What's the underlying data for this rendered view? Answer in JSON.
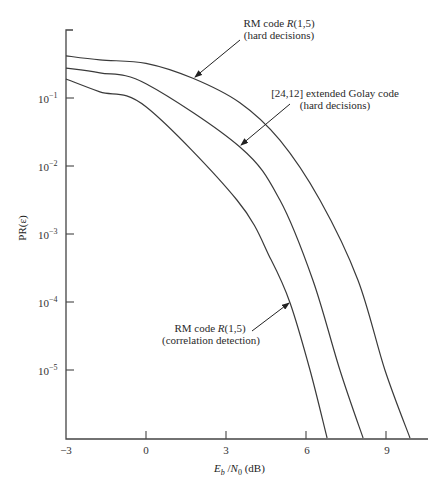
{
  "chart_data": {
    "type": "line",
    "title": "",
    "xlabel": "E_b / N_0 (dB)",
    "ylabel": "PR(ε)",
    "xlim": [
      -3,
      10.5
    ],
    "ylim": [
      1e-06,
      1
    ],
    "yscale": "log",
    "grid": false,
    "legend": "inline annotations with arrows",
    "x_ticks": [
      "-3",
      "0",
      "3",
      "6",
      "9"
    ],
    "x_tick_values": [
      -3,
      0,
      3,
      6,
      9
    ],
    "y_ticks": [
      "10^-1",
      "10^-2",
      "10^-3",
      "10^-4",
      "10^-5"
    ],
    "y_tick_values": [
      0.1,
      0.01,
      0.001,
      0.0001,
      1e-05
    ],
    "series": [
      {
        "name": "RM code R(1,5) (hard decisions)",
        "x": [
          -3,
          -1.73,
          0,
          1.76,
          3.52,
          5.02,
          6.52,
          7.95,
          8.96,
          9.9
        ],
        "log10_y": [
          -0.38,
          -0.44,
          -0.49,
          -0.71,
          -1.07,
          -1.62,
          -2.5,
          -3.68,
          -5.0,
          -6.0
        ]
      },
      {
        "name": "[24,12] extended Golay code (hard decisions)",
        "x": [
          -3,
          -1.73,
          0,
          3.52,
          5.02,
          6.26,
          7.27,
          8.14
        ],
        "log10_y": [
          -0.56,
          -0.63,
          -0.79,
          -1.72,
          -2.5,
          -3.68,
          -5.0,
          -6.0
        ]
      },
      {
        "name": "RM code R(1,5) (correlation detection)",
        "x": [
          -3,
          -1.73,
          0,
          3.41,
          4.69,
          5.4,
          6.15,
          6.79
        ],
        "log10_y": [
          -0.72,
          -0.91,
          -1.13,
          -2.5,
          -3.38,
          -4.01,
          -5.0,
          -6.0
        ]
      }
    ],
    "annotations": [
      {
        "line1_pre": "RM code ",
        "line1_it": "R",
        "line1_post": "(1,5)",
        "line2": "(hard decisions)"
      },
      {
        "line1_pre": "[24,12] extended Golay code",
        "line1_it": "",
        "line1_post": "",
        "line2": "(hard decisions)"
      },
      {
        "line1_pre": "RM code ",
        "line1_it": "R",
        "line1_post": "(1,5)",
        "line2": "(correlation detection)"
      }
    ]
  },
  "axis": {
    "ylabel": "PR(ε)",
    "xlabel_E": "E",
    "xlabel_b": "b",
    "xlabel_slash": " /",
    "xlabel_N": "N",
    "xlabel_0": "0",
    "xlabel_unit": " (dB)",
    "ytick_base": "10",
    "ytick_exps": [
      "−1",
      "−2",
      "−3",
      "−4",
      "−5"
    ],
    "xticks": [
      "−3",
      "0",
      "3",
      "6",
      "9"
    ]
  }
}
